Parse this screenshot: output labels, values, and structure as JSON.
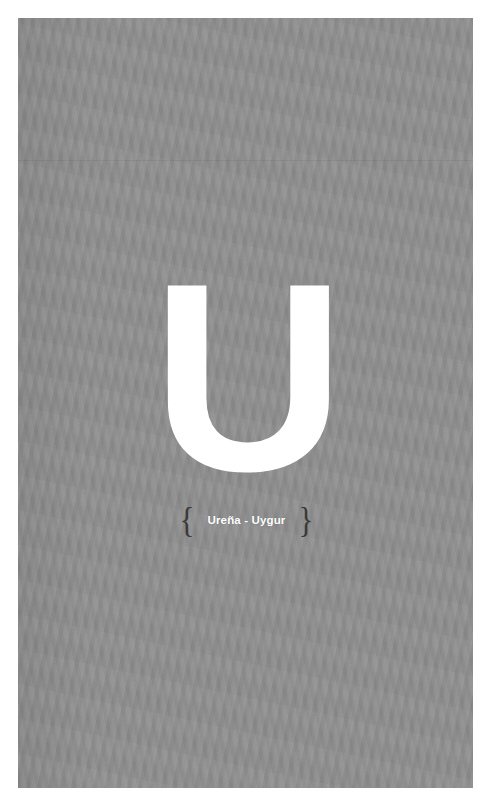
{
  "page": {
    "background_color": "#8f8f8f",
    "sheet_color": "#ffffff",
    "letter": "U",
    "letter_color": "#ffffff"
  },
  "caption": {
    "open_brace": "{",
    "close_brace": "}",
    "range_text": "Ureña - Uygur",
    "range_start": "Ureña",
    "range_end": "Uygur",
    "separator": "-",
    "text_color": "#ffffff",
    "brace_color": "#3a3a3a"
  }
}
